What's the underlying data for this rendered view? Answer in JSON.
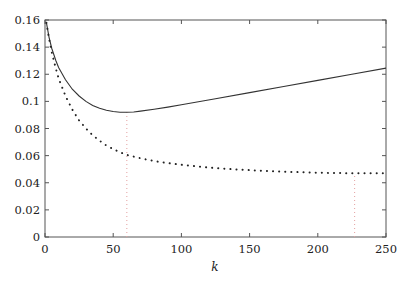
{
  "chart_data": {
    "type": "line",
    "title": "",
    "xlabel": "k",
    "ylabel": "",
    "xlim": [
      0,
      250
    ],
    "ylim": [
      0,
      0.16
    ],
    "grid": false,
    "legend": null,
    "xticks": [
      0,
      50,
      100,
      150,
      200,
      250
    ],
    "xtick_labels": [
      "0",
      "50",
      "100",
      "150",
      "200",
      "250"
    ],
    "yticks": [
      0,
      0.02,
      0.04,
      0.06,
      0.08,
      0.1,
      0.12,
      0.14,
      0.16
    ],
    "ytick_labels": [
      "0",
      "0.02",
      "0.04",
      "0.06",
      "0.08",
      "0.1",
      "0.12",
      "0.14",
      "0.16"
    ],
    "series": [
      {
        "name": "solid",
        "style": "solid",
        "x": [
          1,
          3,
          5,
          8,
          10,
          15,
          20,
          25,
          30,
          35,
          40,
          45,
          50,
          55,
          60,
          65,
          70,
          80,
          90,
          100,
          125,
          150,
          175,
          200,
          225,
          250
        ],
        "y": [
          0.158,
          0.147,
          0.139,
          0.13,
          0.125,
          0.116,
          0.109,
          0.104,
          0.1,
          0.097,
          0.095,
          0.0935,
          0.0925,
          0.092,
          0.092,
          0.0922,
          0.0928,
          0.0942,
          0.0958,
          0.0975,
          0.102,
          0.1065,
          0.111,
          0.1155,
          0.12,
          0.1245
        ]
      },
      {
        "name": "dotted",
        "style": "dotted",
        "x": [
          1,
          3,
          5,
          8,
          10,
          15,
          20,
          25,
          30,
          35,
          40,
          45,
          50,
          55,
          60,
          70,
          80,
          90,
          100,
          120,
          140,
          160,
          180,
          200,
          225,
          250
        ],
        "y": [
          0.158,
          0.146,
          0.136,
          0.124,
          0.117,
          0.104,
          0.094,
          0.086,
          0.08,
          0.075,
          0.071,
          0.0675,
          0.0648,
          0.0625,
          0.0605,
          0.058,
          0.056,
          0.0545,
          0.0532,
          0.0512,
          0.0498,
          0.0488,
          0.048,
          0.0474,
          0.047,
          0.047
        ]
      }
    ],
    "annotations": [
      {
        "type": "vline",
        "x": 60,
        "y_to": 0.092,
        "style": "dotted",
        "color": "#e3a0a0"
      },
      {
        "type": "vline",
        "x": 227,
        "y_to": 0.047,
        "style": "dotted",
        "color": "#e3a0a0"
      }
    ]
  },
  "colors": {
    "axis": "#555555",
    "solid_line": "#333333",
    "dotted_line": "#222222",
    "marker_line": "#e3a0a0"
  }
}
